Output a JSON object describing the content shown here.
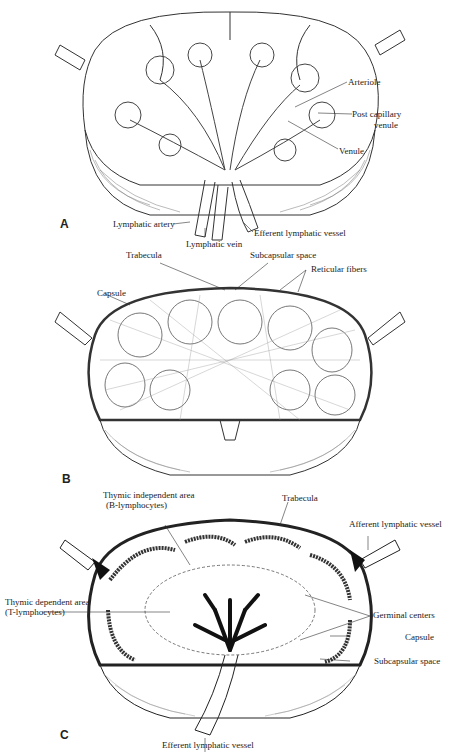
{
  "figure": {
    "panels": [
      {
        "id": "A",
        "letter": "A",
        "labels": {
          "arteriole": "Arteriole",
          "post_capillary_1": "Post capillary",
          "post_capillary_2": "venule",
          "venule": "Venule",
          "lymphatic_artery": "Lymphatic artery",
          "lymphatic_vein": "Lymphatic vein",
          "efferent": "Efferent lymphatic vessel"
        }
      },
      {
        "id": "B",
        "letter": "B",
        "labels": {
          "trabecula": "Trabecula",
          "subcapsular": "Subcapsular space",
          "capsule": "Capsule",
          "reticular": "Reticular fibers"
        }
      },
      {
        "id": "C",
        "letter": "C",
        "labels": {
          "thymic_indep_1": "Thymic independent area",
          "thymic_indep_2": "(B-lymphocytes)",
          "trabecula": "Trabecula",
          "afferent": "Afferent lymphatic vessel",
          "thymic_dep_1": "Thymic dependent area",
          "thymic_dep_2": "(T-lymphocytes)",
          "germinal": "Germinal centers",
          "capsule": "Capsule",
          "subcapsular": "Subcapsular space",
          "efferent": "Efferent lymphatic vessel"
        }
      }
    ]
  }
}
